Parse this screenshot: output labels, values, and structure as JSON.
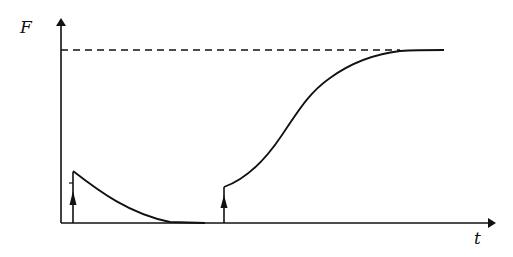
{
  "diagram": {
    "axes": {
      "y_label": "F",
      "x_label": "t"
    },
    "saturation_level": {
      "style": "dashed",
      "meaning": "asymptotic maximum of F"
    },
    "events": [
      {
        "name": "first-impulse",
        "type": "arrow-up",
        "response": "exponential decay to zero"
      },
      {
        "name": "second-impulse",
        "type": "arrow-up",
        "response": "sigmoidal growth to saturation"
      }
    ],
    "colors": {
      "ink": "#111111",
      "background": "#ffffff"
    }
  }
}
